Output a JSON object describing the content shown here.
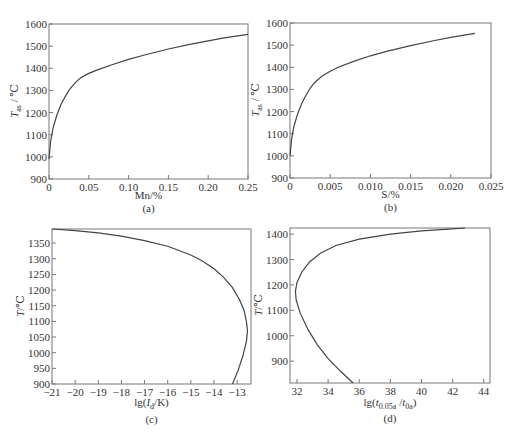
{
  "chart_data": [
    {
      "id": "a",
      "type": "line",
      "caption": "(a)",
      "xlabel": "Mn/%",
      "ylabel_main": "T",
      "ylabel_sub": "as",
      "ylabel_unit": " / ℃",
      "xlim": [
        0,
        0.25
      ],
      "ylim": [
        900,
        1600
      ],
      "xticks": [
        0,
        0.05,
        0.1,
        0.15,
        0.2,
        0.25
      ],
      "xtick_labels": [
        "0",
        "0.05",
        "0.10",
        "0.15",
        "0.20",
        "0.25"
      ],
      "yticks": [
        900,
        1000,
        1100,
        1200,
        1300,
        1400,
        1500,
        1600
      ],
      "ytick_labels": [
        "900",
        "1000",
        "1100",
        "1200",
        "1300",
        "1400",
        "1500",
        "1600"
      ],
      "grid": false,
      "series": [
        {
          "name": "Tas vs Mn",
          "x": [
            0,
            0.002,
            0.005,
            0.01,
            0.015,
            0.02,
            0.025,
            0.03,
            0.035,
            0.04,
            0.045,
            0.05,
            0.06,
            0.08,
            0.1,
            0.12,
            0.15,
            0.18,
            0.2,
            0.22,
            0.25
          ],
          "y": [
            990,
            1070,
            1130,
            1190,
            1235,
            1270,
            1300,
            1323,
            1342,
            1357,
            1368,
            1377,
            1392,
            1417,
            1440,
            1460,
            1487,
            1510,
            1524,
            1537,
            1553
          ]
        }
      ]
    },
    {
      "id": "b",
      "type": "line",
      "caption": "(b)",
      "xlabel": "S/%",
      "ylabel_main": "T",
      "ylabel_sub": "as",
      "ylabel_unit": " / ℃",
      "xlim": [
        0,
        0.025
      ],
      "ylim": [
        900,
        1600
      ],
      "xticks": [
        0,
        0.005,
        0.01,
        0.015,
        0.02,
        0.025
      ],
      "xtick_labels": [
        "0",
        "0.005",
        "0.010",
        "0.015",
        "0.020",
        "0.025"
      ],
      "yticks": [
        900,
        1000,
        1100,
        1200,
        1300,
        1400,
        1500,
        1600
      ],
      "ytick_labels": [
        "900",
        "1000",
        "1100",
        "1200",
        "1300",
        "1400",
        "1500",
        "1600"
      ],
      "grid": false,
      "series": [
        {
          "name": "Tas vs S",
          "x": [
            0,
            0.0002,
            0.0005,
            0.001,
            0.0015,
            0.002,
            0.0025,
            0.003,
            0.0035,
            0.004,
            0.005,
            0.006,
            0.008,
            0.01,
            0.012,
            0.015,
            0.018,
            0.02,
            0.023
          ],
          "y": [
            1000,
            1075,
            1135,
            1195,
            1240,
            1275,
            1305,
            1328,
            1345,
            1360,
            1382,
            1400,
            1428,
            1452,
            1472,
            1498,
            1521,
            1535,
            1553
          ]
        }
      ]
    },
    {
      "id": "c",
      "type": "line",
      "caption": "(c)",
      "xlabel_pre": "lg(",
      "xlabel_main": "I",
      "xlabel_sub": "d",
      "xlabel_post": "/K)",
      "ylabel": "T/℃",
      "xlim": [
        -21,
        -12.4
      ],
      "ylim": [
        900,
        1395
      ],
      "xticks": [
        -21,
        -20,
        -19,
        -18,
        -17,
        -16,
        -15,
        -14,
        -13
      ],
      "xtick_labels": [
        "−21",
        "−20",
        "−19",
        "−18",
        "−17",
        "−16",
        "−15",
        "−14",
        "−13"
      ],
      "yticks": [
        900,
        950,
        1000,
        1050,
        1100,
        1150,
        1200,
        1250,
        1300,
        1350
      ],
      "ytick_labels": [
        "900",
        "950",
        "1000",
        "1050",
        "1100",
        "1150",
        "1200",
        "1250",
        "1300",
        "1350"
      ],
      "grid": false,
      "series": [
        {
          "name": "lg(Id/K) vs T",
          "x": [
            -21,
            -20,
            -19,
            -18,
            -17,
            -16,
            -15,
            -14.5,
            -14,
            -13.6,
            -13.2,
            -12.9,
            -12.7,
            -12.6,
            -12.55,
            -12.6,
            -12.75,
            -12.95,
            -13.2
          ],
          "y": [
            1395,
            1390,
            1383,
            1372,
            1358,
            1340,
            1312,
            1293,
            1268,
            1242,
            1208,
            1170,
            1135,
            1100,
            1070,
            1035,
            990,
            945,
            900
          ]
        }
      ]
    },
    {
      "id": "d",
      "type": "line",
      "caption": "(d)",
      "xlabel_pre": "lg(",
      "xlabel_main1": "t",
      "xlabel_sub1": "0.05a",
      "xlabel_mid": " /",
      "xlabel_main2": "t",
      "xlabel_sub2": "0a",
      "xlabel_post": ")",
      "ylabel": "T/℃",
      "xlim": [
        31.55,
        44.4
      ],
      "ylim": [
        814,
        1424
      ],
      "xticks": [
        32,
        34,
        36,
        38,
        40,
        42,
        44
      ],
      "xtick_labels": [
        "32",
        "34",
        "36",
        "38",
        "40",
        "42",
        "44"
      ],
      "yticks": [
        900,
        1000,
        1100,
        1200,
        1300,
        1400
      ],
      "ytick_labels": [
        "900",
        "1000",
        "1100",
        "1200",
        "1300",
        "1400"
      ],
      "grid": false,
      "series": [
        {
          "name": "lg(t0.05a/t0a) vs T",
          "x": [
            35.6,
            34.8,
            34.0,
            33.3,
            32.7,
            32.2,
            31.95,
            31.9,
            32.0,
            32.3,
            32.8,
            33.5,
            34.5,
            36.0,
            38.0,
            40.0,
            42.0,
            42.8
          ],
          "y": [
            814,
            860,
            910,
            965,
            1025,
            1090,
            1140,
            1175,
            1210,
            1250,
            1290,
            1325,
            1355,
            1380,
            1400,
            1413,
            1421,
            1424
          ]
        }
      ]
    }
  ],
  "labels": {
    "a_caption": "(a)",
    "b_caption": "(b)",
    "c_caption": "(c)",
    "d_caption": "(d)",
    "a_xlabel": "Mn/%",
    "b_xlabel": "S/%",
    "c_ylabel": "T/℃",
    "d_ylabel": "T/℃"
  }
}
